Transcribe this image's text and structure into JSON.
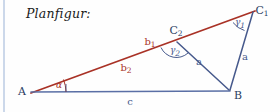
{
  "figure": {
    "title": "Planfigur:",
    "colors": {
      "red": "#a93226",
      "blue": "#46598c",
      "baseline_blue": "#5a6fa5",
      "rule": "#ccd8ea",
      "background": "#fefefe"
    },
    "vertices": [
      {
        "name": "A",
        "label": "A",
        "sub": "",
        "x": 33,
        "y": 92
      },
      {
        "name": "B",
        "label": "B",
        "sub": "",
        "x": 229,
        "y": 91
      },
      {
        "name": "C1",
        "label": "C",
        "sub": "1",
        "x": 253,
        "y": 11
      },
      {
        "name": "C2",
        "label": "C",
        "sub": "2",
        "x": 176,
        "y": 42
      }
    ],
    "sides": [
      {
        "name": "b1",
        "label": "b",
        "sub": "1",
        "color": "red",
        "from": "C2",
        "to": "C1",
        "label_x": 150,
        "label_y": 42
      },
      {
        "name": "b2",
        "label": "b",
        "sub": "2",
        "color": "red",
        "from": "A",
        "to": "C2",
        "label_x": 126,
        "label_y": 68
      },
      {
        "name": "a_c1b",
        "label": "a",
        "sub": "",
        "color": "blue",
        "from": "C1",
        "to": "B",
        "label_x": 245,
        "label_y": 57
      },
      {
        "name": "a_c2b",
        "label": "a",
        "sub": "",
        "color": "blue",
        "from": "C2",
        "to": "B",
        "label_x": 199,
        "label_y": 62
      },
      {
        "name": "c",
        "label": "c",
        "sub": "",
        "color": "blue",
        "from": "A",
        "to": "B",
        "label_x": 130,
        "label_y": 101
      }
    ],
    "angles": [
      {
        "name": "alpha",
        "label": "α",
        "sub": "",
        "color": "red",
        "vertex": "A",
        "label_x": 59,
        "label_y": 87
      },
      {
        "name": "gamma1",
        "label": "γ",
        "sub": "1",
        "color": "blue",
        "vertex": "C1",
        "label_x": 240,
        "label_y": 24
      },
      {
        "name": "gamma2",
        "label": "γ",
        "sub": "2",
        "color": "blue",
        "vertex": "C2",
        "label_x": 175,
        "label_y": 53
      }
    ]
  }
}
